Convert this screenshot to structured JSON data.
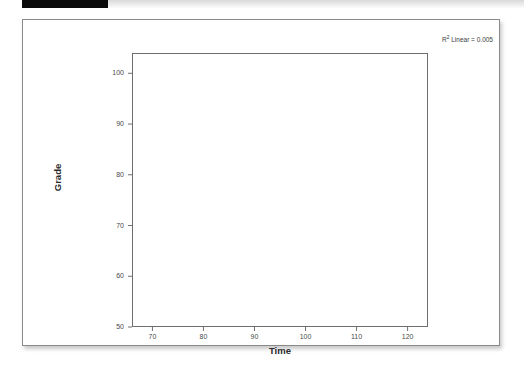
{
  "header": {
    "tab_color": "#0a0a0a",
    "strip_color": "#e9e9e9"
  },
  "annotation": {
    "r2_prefix": "R",
    "r2_sup": "2",
    "r2_text": " Linear = 0.005"
  },
  "chart_data": {
    "type": "scatter",
    "title": "",
    "subtitle": "",
    "xlabel": "Time",
    "ylabel": "Grade",
    "xlim": [
      66,
      124
    ],
    "ylim": [
      50,
      104
    ],
    "xticks": [
      70,
      80,
      90,
      100,
      110,
      120
    ],
    "yticks": [
      50,
      60,
      70,
      80,
      90,
      100
    ],
    "xtick_labels": [
      "70",
      "80",
      "90",
      "100",
      "110",
      "120"
    ],
    "ytick_labels": [
      "50",
      "60",
      "70",
      "80",
      "90",
      "100"
    ],
    "grid": false,
    "legend": null,
    "marker": {
      "shape": "open-circle",
      "radius": 3,
      "stroke": "#555555",
      "fill": "none"
    },
    "points": [
      {
        "x": 73.0,
        "y": 67.0
      },
      {
        "x": 74.5,
        "y": 91.0
      },
      {
        "x": 76.0,
        "y": 60.3
      },
      {
        "x": 78.0,
        "y": 84.0
      },
      {
        "x": 81.0,
        "y": 62.2
      },
      {
        "x": 83.0,
        "y": 62.0
      },
      {
        "x": 83.5,
        "y": 77.5
      },
      {
        "x": 87.0,
        "y": 79.0
      },
      {
        "x": 89.5,
        "y": 66.0
      },
      {
        "x": 91.0,
        "y": 85.0
      },
      {
        "x": 91.5,
        "y": 72.8
      },
      {
        "x": 93.5,
        "y": 79.0
      },
      {
        "x": 95.0,
        "y": 82.0
      },
      {
        "x": 95.5,
        "y": 70.0
      },
      {
        "x": 96.5,
        "y": 61.0
      },
      {
        "x": 97.5,
        "y": 77.5
      },
      {
        "x": 100.8,
        "y": 95.0
      },
      {
        "x": 102.0,
        "y": 54.8
      },
      {
        "x": 102.5,
        "y": 73.4
      },
      {
        "x": 105.5,
        "y": 95.0
      },
      {
        "x": 106.0,
        "y": 81.0
      },
      {
        "x": 107.5,
        "y": 70.0
      },
      {
        "x": 110.0,
        "y": 80.0
      },
      {
        "x": 110.5,
        "y": 62.0
      },
      {
        "x": 115.0,
        "y": 76.5
      },
      {
        "x": 115.5,
        "y": 51.8
      },
      {
        "x": 119.5,
        "y": 67.0
      },
      {
        "x": 120.0,
        "y": 89.5
      },
      {
        "x": 120.5,
        "y": 64.0
      }
    ],
    "fit_line": {
      "type": "linear",
      "stroke": "#4f4f4f",
      "x_start": 66,
      "y_start": 75.9,
      "x_end": 124,
      "y_end": 72.2,
      "r_squared": 0.005
    }
  }
}
